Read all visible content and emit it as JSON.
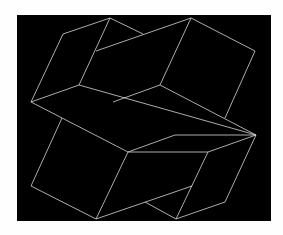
{
  "artwork": {
    "background_color": "#fefefe",
    "panel_color": "#000000",
    "line_color": "#d8d8d8",
    "panel": {
      "x": 17,
      "y": 15,
      "width": 254,
      "height": 206
    },
    "lines": [
      [
        110,
        18,
        63,
        34
      ],
      [
        63,
        34,
        31,
        102
      ],
      [
        31,
        102,
        79,
        85
      ],
      [
        79,
        85,
        110,
        18
      ],
      [
        110,
        18,
        143,
        34
      ],
      [
        96,
        51,
        191,
        18
      ],
      [
        191,
        18,
        255,
        51
      ],
      [
        255,
        51,
        225,
        118
      ],
      [
        191,
        18,
        160,
        85
      ],
      [
        79,
        85,
        256,
        135
      ],
      [
        113,
        102,
        160,
        85
      ],
      [
        160,
        85,
        256,
        135
      ],
      [
        31,
        102,
        128,
        152
      ],
      [
        62,
        118,
        31,
        186
      ],
      [
        31,
        186,
        96,
        219
      ],
      [
        128,
        152,
        175,
        135
      ],
      [
        128,
        152,
        96,
        219
      ],
      [
        175,
        135,
        256,
        135
      ],
      [
        256,
        135,
        208,
        152
      ],
      [
        128,
        152,
        208,
        152
      ],
      [
        208,
        152,
        176,
        219
      ],
      [
        256,
        135,
        225,
        202
      ],
      [
        96,
        219,
        192,
        186
      ],
      [
        145,
        202,
        176,
        219
      ],
      [
        176,
        219,
        225,
        202
      ]
    ]
  }
}
